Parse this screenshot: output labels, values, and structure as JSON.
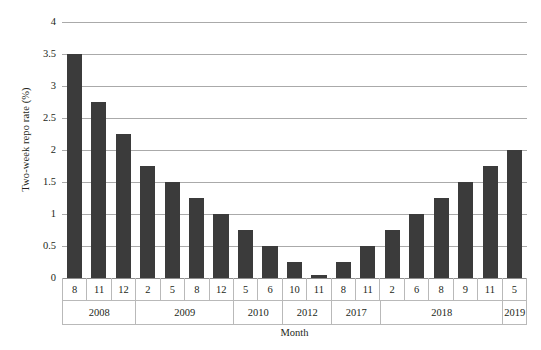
{
  "chart_data": {
    "type": "bar",
    "title": "",
    "xlabel": "Month",
    "ylabel": "Two-week repo rate (%)",
    "ylim": [
      0,
      4
    ],
    "ytick_step": 0.5,
    "ytick_labels": [
      "0",
      "0.5",
      "1",
      "1.5",
      "2",
      "2.5",
      "3",
      "3.5",
      "4"
    ],
    "ytick_values": [
      0,
      0.5,
      1,
      1.5,
      2,
      2.5,
      3,
      3.5,
      4
    ],
    "grid": true,
    "legend": "none",
    "bar_color": "#3b3b3b",
    "gridline_color": "#aaaaaa",
    "categories": [
      "8",
      "11",
      "12",
      "2",
      "5",
      "8",
      "12",
      "5",
      "6",
      "10",
      "11",
      "8",
      "11",
      "2",
      "6",
      "8",
      "9",
      "11",
      "5"
    ],
    "values": [
      3.5,
      2.75,
      2.25,
      1.75,
      1.5,
      1.25,
      1.0,
      0.75,
      0.5,
      0.25,
      0.05,
      0.25,
      0.5,
      0.75,
      1.0,
      1.25,
      1.5,
      1.75,
      2.0
    ],
    "groups": [
      {
        "label": "2008",
        "span": 3
      },
      {
        "label": "2009",
        "span": 4
      },
      {
        "label": "2010",
        "span": 2
      },
      {
        "label": "2012",
        "span": 2
      },
      {
        "label": "2017",
        "span": 2
      },
      {
        "label": "2018",
        "span": 5
      },
      {
        "label": "2019",
        "span": 1
      }
    ]
  }
}
